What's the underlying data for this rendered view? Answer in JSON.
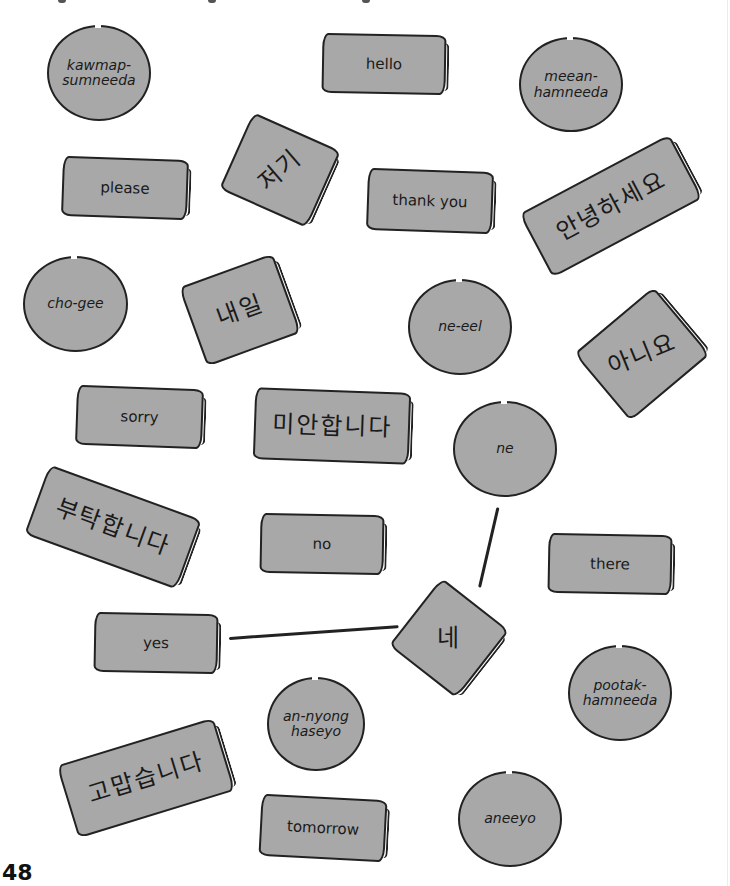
{
  "page_number": "48",
  "colors": {
    "card_fill": "#a8a8a8",
    "outline": "#222222",
    "background": "#ffffff"
  },
  "english_cards": [
    {
      "id": "hello",
      "label": "hello"
    },
    {
      "id": "please",
      "label": "please"
    },
    {
      "id": "thank-you",
      "label": "thank you"
    },
    {
      "id": "sorry",
      "label": "sorry"
    },
    {
      "id": "no",
      "label": "no"
    },
    {
      "id": "there",
      "label": "there"
    },
    {
      "id": "yes",
      "label": "yes"
    },
    {
      "id": "tomorrow",
      "label": "tomorrow"
    }
  ],
  "korean_cards": [
    {
      "id": "jeogi",
      "label": "저기"
    },
    {
      "id": "annyeonghaseyo",
      "label": "안녕하세요"
    },
    {
      "id": "naeil",
      "label": "내일"
    },
    {
      "id": "aniyo",
      "label": "아니요"
    },
    {
      "id": "mianhamnida",
      "label": "미안합니다"
    },
    {
      "id": "butakhamnida",
      "label": "부탁합니다"
    },
    {
      "id": "ne",
      "label": "네"
    },
    {
      "id": "gomapseumnida",
      "label": "고맙습니다"
    }
  ],
  "romanized_circles": [
    {
      "id": "kawmap",
      "line1": "kawmap-",
      "line2": "sumneeda"
    },
    {
      "id": "meean",
      "line1": "meean-",
      "line2": "hamneeda"
    },
    {
      "id": "cho-gee",
      "line1": "cho-gee",
      "line2": ""
    },
    {
      "id": "ne-eel",
      "line1": "ne-eel",
      "line2": ""
    },
    {
      "id": "ne",
      "line1": "ne",
      "line2": ""
    },
    {
      "id": "pootak",
      "line1": "pootak-",
      "line2": "hamneeda"
    },
    {
      "id": "an-nyong",
      "line1": "an-nyong",
      "line2": "haseyo"
    },
    {
      "id": "aneeyo",
      "line1": "aneeyo",
      "line2": ""
    }
  ],
  "connections": [
    {
      "from": "ne-circle",
      "to": "ne-korean"
    },
    {
      "from": "yes",
      "to": "ne-korean"
    }
  ]
}
